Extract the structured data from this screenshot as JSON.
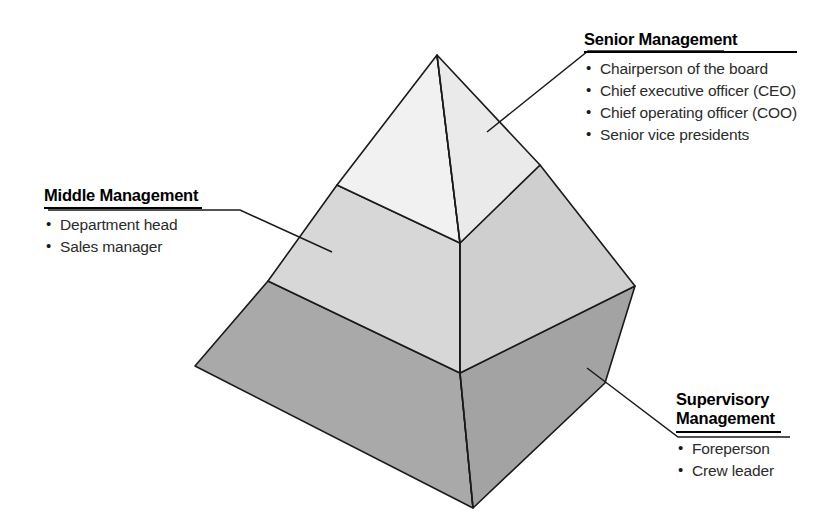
{
  "diagram": {
    "shape": "three-tier-3d-pyramid",
    "tiers": [
      {
        "id": "senior",
        "name": "Senior Management",
        "level": 1,
        "position": "top",
        "fill_left": "#f1f1f1",
        "fill_right": "#eaeaea",
        "items": [
          "Chairperson of the board",
          "Chief executive officer (CEO)",
          "Chief operating officer (COO)",
          "Senior vice presidents"
        ]
      },
      {
        "id": "middle",
        "name": "Middle Management",
        "level": 2,
        "position": "middle",
        "fill_left": "#d7d7d7",
        "fill_right": "#cfcfcf",
        "items": [
          "Department head",
          "Sales manager"
        ]
      },
      {
        "id": "supervisory",
        "name": "Supervisory Management",
        "name_line_1": "Supervisory",
        "name_line_2": "Management",
        "level": 3,
        "position": "bottom",
        "fill_left": "#a9a9a9",
        "fill_right": "#a3a3a3",
        "items": [
          "Foreperson",
          "Crew leader"
        ]
      }
    ],
    "stroke_color": "#1a1a1a",
    "background_color": "#ffffff",
    "leader_line_color": "#1a1a1a"
  }
}
